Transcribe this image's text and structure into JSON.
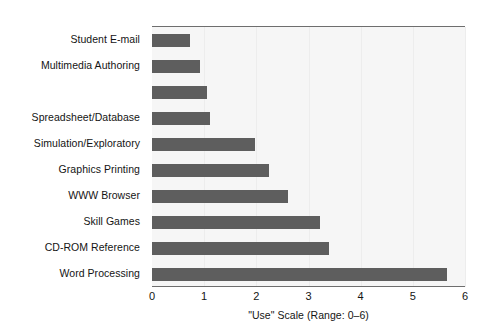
{
  "chart_data": {
    "type": "bar",
    "orientation": "horizontal",
    "title": "",
    "xlabel": "\"Use\" Scale (Range: 0–6)",
    "ylabel": "",
    "xlim": [
      0,
      6
    ],
    "xticks": [
      "0",
      "1",
      "2",
      "3",
      "4",
      "5",
      "6"
    ],
    "grid": true,
    "legend": null,
    "bar_color": "#5e5e5e",
    "plot_background": "#f6f6f6",
    "axis_color": "#6e6e6e",
    "categories": [
      "Student E-mail",
      "Multimedia Authoring",
      "",
      "Spreadsheet/Database",
      "Simulation/Exploratory",
      "Graphics Printing",
      "WWW Browser",
      "Skill Games",
      "CD-ROM Reference",
      "Word Processing"
    ],
    "values": [
      0.73,
      0.92,
      1.06,
      1.12,
      1.98,
      2.25,
      2.6,
      3.22,
      3.4,
      5.65
    ]
  }
}
